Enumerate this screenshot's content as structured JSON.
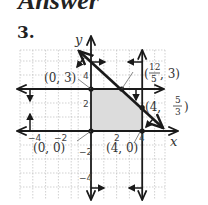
{
  "header": {
    "title": "Answer",
    "problem_number": "3."
  },
  "graph": {
    "x_axis_label": "x",
    "y_axis_label": "y",
    "x_ticks": [
      "−4",
      "−2",
      "2",
      "4"
    ],
    "y_ticks": [
      "4",
      "2",
      "−2",
      "−4"
    ],
    "vertices": [
      {
        "label": "(0, 3)",
        "x": 0,
        "y": 3
      },
      {
        "label": "(0, 0)",
        "x": 0,
        "y": 0
      },
      {
        "label": "(4, 0)",
        "x": 4,
        "y": 0
      },
      {
        "label_main": "(4, ",
        "label_num": "5",
        "label_den": "3",
        "label_end": ")",
        "x": 4,
        "y": 1.667
      },
      {
        "label_main": "(",
        "label_num": "12",
        "label_den": "5",
        "label_end": ", 3)",
        "x": 2.4,
        "y": 3
      }
    ],
    "boundary_lines": [
      "y = 3",
      "x = 0",
      "y = 0",
      "x = 4",
      "5x + 6y = 30"
    ],
    "colors": {
      "line": "#1a1a1a",
      "grid": "#b8b8b8",
      "shade": "#dcdcdc"
    }
  }
}
